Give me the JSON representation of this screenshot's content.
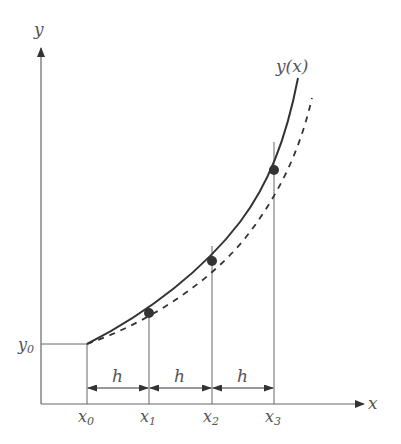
{
  "diagram": {
    "axes": {
      "x_label": "x",
      "y_label": "y"
    },
    "curve_label": "y(x)",
    "y0_label": "y",
    "y0_sub": "0",
    "x_ticks": [
      {
        "base": "x",
        "sub": "0"
      },
      {
        "base": "x",
        "sub": "1"
      },
      {
        "base": "x",
        "sub": "2"
      },
      {
        "base": "x",
        "sub": "3"
      }
    ],
    "step_labels": [
      "h",
      "h",
      "h"
    ],
    "points": [
      {
        "x": 149,
        "y": 313
      },
      {
        "x": 212,
        "y": 261
      },
      {
        "x": 274,
        "y": 170
      }
    ],
    "colors": {
      "line": "#333333",
      "axis": "#666666",
      "point": "#333333"
    }
  }
}
